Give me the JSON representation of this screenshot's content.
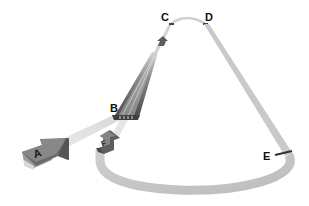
{
  "diagram": {
    "type": "flow-loop",
    "background": "#ffffff",
    "colors": {
      "path_light": "#c8c8c8",
      "path_mid": "#b4b4b4",
      "path_faint": "#e2e2e2",
      "arrow_dark": "#5a5a5a",
      "arrow_mid": "#777777",
      "arrow_face": "#8a8a8a",
      "marker": "#333333",
      "label": "#111111"
    },
    "labels": {
      "A": "A",
      "B": "B",
      "C": "C",
      "D": "D",
      "E": "E",
      "F": "F"
    },
    "nodes": [
      {
        "id": "A",
        "kind": "large-arrow",
        "description": "Entry arrow at lower left"
      },
      {
        "id": "B",
        "kind": "tapered-channel-base",
        "description": "Base of dark tapered channel"
      },
      {
        "id": "C",
        "kind": "point-marker",
        "description": "Top-left of arch"
      },
      {
        "id": "D",
        "kind": "point-marker",
        "description": "Top-right of arch"
      },
      {
        "id": "E",
        "kind": "bar-marker",
        "description": "Right side of loop"
      },
      {
        "id": "F",
        "kind": "return-arrow",
        "description": "Return arrow rejoining near B"
      }
    ],
    "edges": [
      {
        "from": "A",
        "to": "B"
      },
      {
        "from": "B",
        "to": "C"
      },
      {
        "from": "C",
        "to": "D"
      },
      {
        "from": "D",
        "to": "E"
      },
      {
        "from": "E",
        "to": "F"
      },
      {
        "from": "F",
        "to": "B"
      }
    ]
  }
}
